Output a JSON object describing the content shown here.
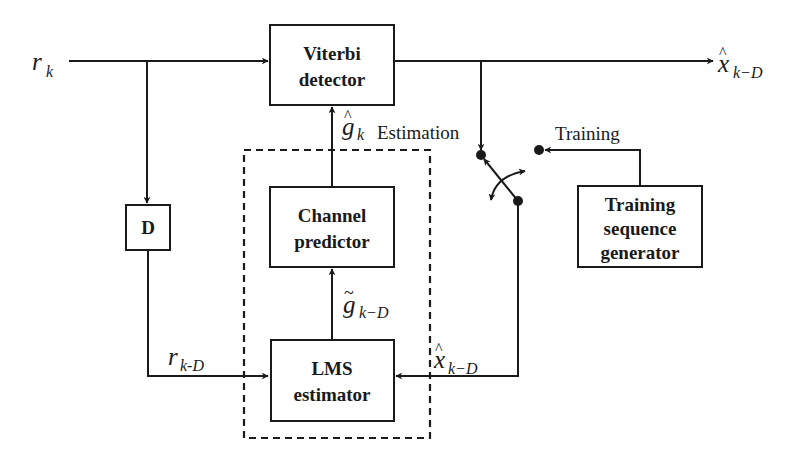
{
  "diagram": {
    "blocks": {
      "viterbi": {
        "line1": "Viterbi",
        "line2": "detector"
      },
      "delay": {
        "label": "D"
      },
      "channel_predictor": {
        "line1": "Channel",
        "line2": "predictor"
      },
      "lms_estimator": {
        "line1": "LMS",
        "line2": "estimator"
      },
      "training_generator": {
        "line1": "Training",
        "line2": "sequence",
        "line3": "generator"
      }
    },
    "signals": {
      "input": {
        "base": "r",
        "sub": "k"
      },
      "output": {
        "base": "x",
        "accent": "^",
        "sub": "k−D"
      },
      "g_hat": {
        "base": "g",
        "accent": "^",
        "sub": "k"
      },
      "g_tilde": {
        "base": "g",
        "accent": "~",
        "sub": "k−D"
      },
      "r_delayed": {
        "base": "r",
        "sub": "k-D"
      },
      "x_hat_feedback": {
        "base": "x",
        "accent": "^",
        "sub": "k−D"
      }
    },
    "switch_labels": {
      "estimation": "Estimation",
      "training": "Training"
    }
  },
  "colors": {
    "stroke": "#1a1a1a",
    "background": "#ffffff"
  }
}
